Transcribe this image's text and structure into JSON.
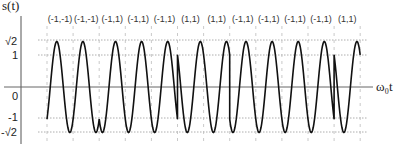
{
  "figure": {
    "y_axis_title": "s(t)",
    "x_axis_title": "ω₀t",
    "y_ticks": [
      {
        "label": "√2",
        "value": 1.4142
      },
      {
        "label": "1",
        "value": 1
      },
      {
        "label": "0",
        "value": 0
      },
      {
        "label": "-1",
        "value": -1
      },
      {
        "label": "-√2",
        "value": -1.4142
      }
    ],
    "symbols": [
      "(-1,-1)",
      "(-1,-1)",
      "(-1,1)",
      "(-1,1)",
      "(-1,1)",
      "(1,1)",
      "(1,1)",
      "(-1,1)",
      "(-1,1)",
      "(-1,1)",
      "(-1,1)",
      "(1,1)"
    ]
  },
  "chart_data": {
    "type": "line",
    "title": "",
    "xlabel": "ω₀t",
    "ylabel": "s(t)",
    "ylim": [
      -1.4142,
      1.4142
    ],
    "yticks": [
      "-√2",
      "-1",
      "0",
      "1",
      "√2"
    ],
    "grid": "dotted horizontal at ±1, ±√2; dashed vertical at symbol boundaries",
    "symbol_labels": [
      "(-1,-1)",
      "(-1,-1)",
      "(-1,1)",
      "(-1,1)",
      "(-1,1)",
      "(1,1)",
      "(1,1)",
      "(-1,1)",
      "(-1,1)",
      "(-1,1)",
      "(-1,1)",
      "(1,1)"
    ],
    "series": [
      {
        "name": "s(t)",
        "description": "sinusoid of amplitude √2, phase set per symbol pair (I,Q)"
      }
    ]
  }
}
